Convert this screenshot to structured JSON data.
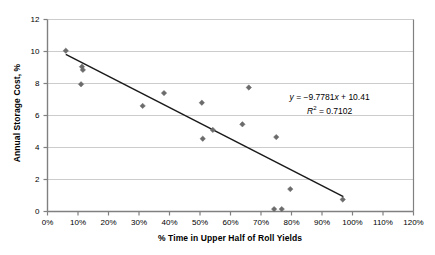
{
  "chart_data": {
    "type": "scatter",
    "title": "",
    "xlabel": "% Time in Upper Half of Roll Yields",
    "ylabel": "Annual Storage Cost, %",
    "xlim": [
      0,
      120
    ],
    "ylim": [
      0,
      12
    ],
    "xticks": [
      "0%",
      "10%",
      "20%",
      "30%",
      "40%",
      "50%",
      "60%",
      "70%",
      "80%",
      "90%",
      "100%",
      "110%",
      "120%"
    ],
    "xtick_values": [
      0,
      10,
      20,
      30,
      40,
      50,
      60,
      70,
      80,
      90,
      100,
      110,
      120
    ],
    "yticks": [
      "0",
      "2",
      "4",
      "6",
      "8",
      "10",
      "12"
    ],
    "ytick_values": [
      0,
      2,
      4,
      6,
      8,
      10,
      12
    ],
    "grid": "horizontal",
    "legend": "none",
    "marker": "diamond",
    "marker_color": "#6b6b6b",
    "trendline_color": "#1a1a1a",
    "gridline_color": "#bfbfbf",
    "axis_color": "#808080",
    "points": [
      {
        "x": 6.0,
        "y": 10.05
      },
      {
        "x": 11.3,
        "y": 9.05
      },
      {
        "x": 11.6,
        "y": 8.85
      },
      {
        "x": 11.0,
        "y": 7.95
      },
      {
        "x": 31.2,
        "y": 6.6
      },
      {
        "x": 38.2,
        "y": 7.4
      },
      {
        "x": 50.6,
        "y": 6.8
      },
      {
        "x": 50.9,
        "y": 4.55
      },
      {
        "x": 54.2,
        "y": 5.1
      },
      {
        "x": 63.9,
        "y": 5.45
      },
      {
        "x": 66.0,
        "y": 7.75
      },
      {
        "x": 75.0,
        "y": 4.65
      },
      {
        "x": 74.3,
        "y": 0.15
      },
      {
        "x": 76.8,
        "y": 0.15
      },
      {
        "x": 79.6,
        "y": 1.4
      },
      {
        "x": 96.8,
        "y": 0.75
      }
    ],
    "trendline": {
      "slope": -9.7781,
      "intercept": 10.41,
      "x_start": 6.0,
      "x_end": 97.0,
      "equation_text": "y = −9.7781x + 10.41",
      "r2_text": "R2 = 0.7102",
      "equation_parts": {
        "y": "y",
        "body": " = −9.7781",
        "x": "x",
        "tail": " + 10.41"
      },
      "r2_parts": {
        "r": "R",
        "sup": "2",
        "value": " = 0.7102"
      }
    }
  }
}
